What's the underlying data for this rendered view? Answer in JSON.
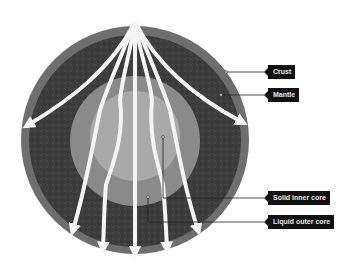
{
  "diagram": {
    "colors": {
      "background": "#ffffff",
      "crust": "#6e6e6e",
      "mantle": "#3d3d3d",
      "outer_core": "#8a8a8a",
      "inner_core": "#a9a9a9",
      "arrows": "#f4f4f4",
      "label_bg": "#111111",
      "label_text": "#e8e8e8",
      "leader_line": "#222222"
    },
    "labels": [
      {
        "id": "crust",
        "text": "Crust"
      },
      {
        "id": "mantle",
        "text": "Mantle"
      },
      {
        "id": "inner-core",
        "text": "Solid inner core"
      },
      {
        "id": "outer-core",
        "text": "Liquid outer core"
      }
    ]
  }
}
